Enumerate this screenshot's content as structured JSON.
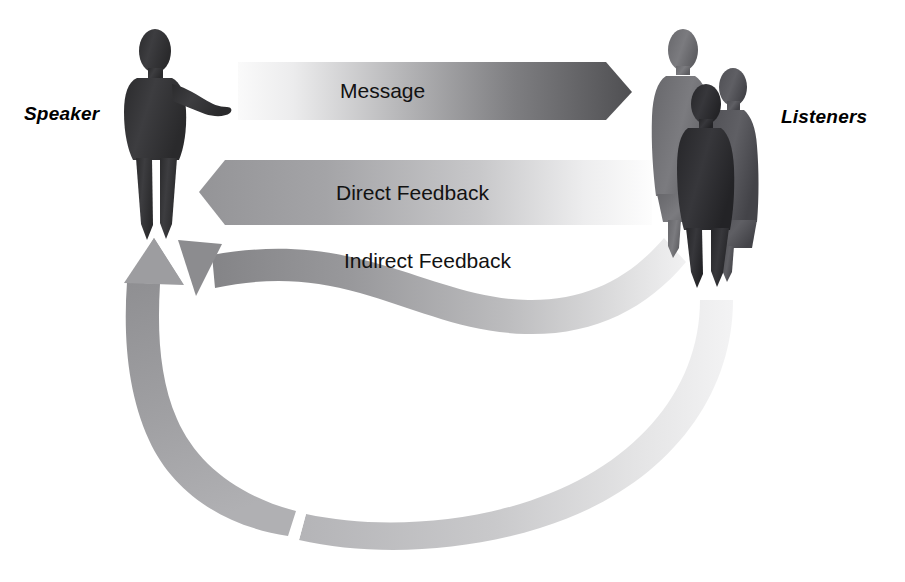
{
  "diagram": {
    "background_color": "#ffffff",
    "roles": {
      "speaker_label": "Speaker",
      "listeners_label": "Listeners"
    },
    "flows": [
      {
        "id": "message",
        "label": "Message",
        "direction": "speaker-to-listeners",
        "shape": "straight-arrow",
        "gradient_from": "#f2f2f2",
        "gradient_to": "#59595b"
      },
      {
        "id": "direct_feedback",
        "label": "Direct Feedback",
        "direction": "listeners-to-speaker",
        "shape": "straight-arrow",
        "gradient_from": "#9a9a9c",
        "gradient_to": "#fbfbfb"
      },
      {
        "id": "indirect_feedback",
        "label": "Indirect Feedback",
        "direction": "listeners-to-speaker",
        "shape": "s-curve-ribbon",
        "gradient_from": "#8e8e90",
        "gradient_to": "#ededee"
      },
      {
        "id": "delayed_feedback_loop",
        "label": "",
        "direction": "listeners-to-speaker",
        "shape": "broken-arc-arrow",
        "gradient_from": "#f4f4f5",
        "gradient_to": "#9a9a9c"
      }
    ],
    "figures": {
      "speaker": {
        "name": "speaker-figure",
        "count": 1,
        "fill": "#3a3a3c"
      },
      "listeners": {
        "name": "listeners-figures",
        "count": 3,
        "fill_back": "#6f6f72",
        "fill_mid": "#55555a",
        "fill_front": "#2f2f33"
      }
    }
  }
}
